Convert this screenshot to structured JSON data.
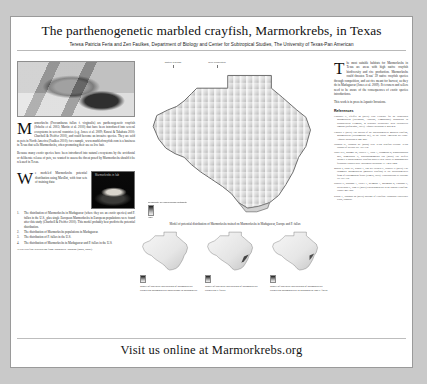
{
  "poster": {
    "title": "The parthenogenetic marbled crayfish, Marmorkrebs, in Texas",
    "authors": "Teresa Patricia Feria and Zen Faulkes, Department of Biology and Center for Subtropical Studies, The University of Texas-Pan American"
  },
  "left": {
    "photo_caption": "Marmorkrebs adult",
    "intro": "armorkrebs (Procambarus fallax f. virginalis) are parthenogenetic crayfish (Scholtz et al. 2003; Martin et al. 2010) that have been introduced into several ecosystems in several countries (e.g. Jones et al. 2009; Kawai & Takahata 2010; Chucholl & Pfeiffer 2010), and could become an invasive species. They are sold as pets in North America (Faulkes 2010); for example, www.marbledcrayfish.com is a business in Texas that sells Marmorkrebs, often promoting their use as live bait.",
    "intro2": "Because many exotic species have been introduced into natural ecosystems by the accidental or deliberate release of pets, we wanted to assess the threat posed by Marmorkrebs should it be released in Texas.",
    "methods_intro": "e modeled Marmorkrebs potential distribution using MaxEnt, with four sets of training data:",
    "methods_list": [
      {
        "num": "1.",
        "text": "The distribution of Marmorkrebs in Madagascar (where they are an exotic species) and P. fallax in the U.S., plus single European Marmorkrebs in European populations were found after this study (Chucholl & Pfeiffer 2010). This model probably best predicts the potential distribution."
      },
      {
        "num": "2.",
        "text": "The distribution of Marmorkrebs populations in Madagascar."
      },
      {
        "num": "3.",
        "text": "The distribution of P. fallax in the U.S."
      },
      {
        "num": "4.",
        "text": "The distribution of Marmorkrebs in Madagascar and P. fallax in the U.S."
      }
    ],
    "footnote": "Texas crayfish distribution from Johnson & Johnson (2008, 2009).",
    "inset_caption": "Marmorkrebs in lab"
  },
  "center": {
    "big_map_caption": "Model of potential distribution of Marmorkrebs trained on Marmorkrebs in Madagascar, Europe and P. fallax",
    "legend_title": "Probability of Marmorkrebs suitability",
    "legend_high": "High",
    "legend_low": "Low",
    "callouts": [
      "Native crayfish",
      "Rice production"
    ],
    "small_maps": [
      {
        "caption": "Model of potential distribution of Marmorkrebs trained on Marmorkrebs populations in Madagascar",
        "inset_label": "Rice (crayfish) habitat"
      },
      {
        "caption": "Model of potential distribution of Marmorkrebs trained on P. fallax",
        "inset_label": ""
      },
      {
        "caption": "Model of potential distribution of Marmorkrebs trained on Marmorkrebs in Madagascar and P. fallax",
        "inset_label": ""
      }
    ]
  },
  "right": {
    "conclusion": "he most suitable habitats for Marmorkrebs in Texas are areas with high native crayfish biodiversity and rice production. Marmorkrebs could threaten Texas' 39 native crayfish species through competition, and eat rice meant for harvest, as they do in Madagascar (Jones et al. 2009). Pet owners and sellers need to be aware of the consequences of exotic species introductions.",
    "conclusion2": "This work is in press in Aquatic Invasions.",
    "references_heading": "References",
    "references": [
      "Chucholl C, Pfeiffer M (2010) First evidence for an established Marmorkrebs (Decapoda, Astacida, Cambaridae) population in Southwestern Germany, in syntopic occurrence with Orconectes limosus (Rafinesque, 1817). Aquatic Invasions 5: 405-412.",
      "Faulkes Z (2010) The spread of the parthenogenetic marbled crayfish, Marmorkrebs (Procambarus sp.), in the North American pet trade. Aquatic Invasions 5: 447-450.",
      "Johnson JE, Johnson RL (2008) New Texas crayfish records. Texas Journal of Science 60: 307-312.",
      "Jones JPG, Rasamy JR, Harvey A, Toon A, Oidtmann B, Randrianarison MH, Raminosoa N, Ravoahangimalala OR (2009) The perfect invader: a parthenogenic crayfish poses a new threat to Madagascar's freshwater biodiversity. Biological Invasions 11: 1475-1482.",
      "Martin P, Dorn NJ, Kawai T, van der Heiden C, Scholtz G (2010) The enigmatic Marmorkrebs (marbled crayfish) is the parthenogenetic form of Procambarus fallax (Hagen, 1870). Contributions to Zoology 79: 107-118.",
      "Scholtz G, Braband A, Tolley L, Reimann A, Mittmann B, Lukhaup C, Steuerwald F, Vogt G (2003) Parthenogenesis in an outsider crayfish. Nature 421: 806.",
      "Kawai T, Takahata M (2010) Biology of Crayfish. Hokkaido University Press, Sapporo."
    ]
  },
  "footer": {
    "banner": "Visit us online at Marmorkrebs.org"
  }
}
